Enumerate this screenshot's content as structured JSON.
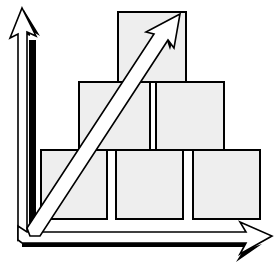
{
  "diagram": {
    "colors": {
      "background": "#ffffff",
      "block_fill": "#eeeeee",
      "stroke": "#000000",
      "arrow_fill": "#ffffff",
      "arrow_shadow": "#000000"
    },
    "blocks": [
      {
        "row": "top",
        "x": 118,
        "y": 12,
        "w": 68,
        "h": 70
      },
      {
        "row": "middle",
        "x": 79,
        "y": 82,
        "w": 71,
        "h": 68
      },
      {
        "row": "middle",
        "x": 156,
        "y": 82,
        "w": 68,
        "h": 68
      },
      {
        "row": "bottom",
        "x": 41,
        "y": 150,
        "w": 66,
        "h": 69
      },
      {
        "row": "bottom",
        "x": 116,
        "y": 150,
        "w": 67,
        "h": 69
      },
      {
        "row": "bottom",
        "x": 193,
        "y": 150,
        "w": 67,
        "h": 69
      }
    ],
    "arrows": [
      {
        "name": "y-axis-arrow",
        "direction": "up"
      },
      {
        "name": "x-axis-arrow",
        "direction": "right"
      },
      {
        "name": "diagonal-growth-arrow",
        "direction": "up-right"
      }
    ]
  }
}
